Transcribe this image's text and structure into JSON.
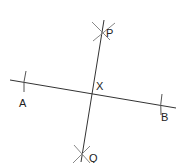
{
  "diagram": {
    "colors": {
      "line": "#333333",
      "arc": "#777777",
      "text": "#222222"
    },
    "points": {
      "A": {
        "label": "A",
        "x": 23,
        "y": 107
      },
      "B": {
        "label": "B",
        "x": 164,
        "y": 121
      },
      "X": {
        "label": "X",
        "x": 99,
        "y": 90
      },
      "P": {
        "label": "P",
        "x": 108,
        "y": 38
      },
      "Q": {
        "label": "Q",
        "x": 91,
        "y": 162
      }
    },
    "segments": [
      {
        "name": "AB",
        "from": [
          10,
          80
        ],
        "to": [
          176,
          108
        ]
      },
      {
        "name": "PQ",
        "from": [
          104,
          20
        ],
        "to": [
          81,
          162
        ]
      }
    ]
  }
}
